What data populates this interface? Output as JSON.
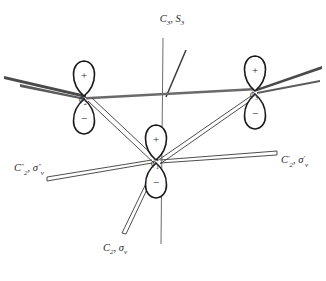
{
  "figure": {
    "title": "",
    "background_color": "#ffffff",
    "stroke_color": "#3a3a3a",
    "orbital_stroke_color": "#1a1a1a",
    "text_color": "#2b2b2b"
  },
  "orbitals": [
    {
      "id": "phi1",
      "label": "ϕ",
      "subscript": "1",
      "position": "center-bottom",
      "cx": 156,
      "cy": 160,
      "top_lobe_sign": "+",
      "bottom_lobe_sign": "−"
    },
    {
      "id": "phi2",
      "label": "ϕ",
      "subscript": "2",
      "position": "left",
      "cx": 84,
      "cy": 96,
      "top_lobe_sign": "+",
      "bottom_lobe_sign": "−"
    },
    {
      "id": "phi3",
      "label": "ϕ",
      "subscript": "3",
      "position": "right",
      "cx": 255,
      "cy": 91,
      "top_lobe_sign": "+",
      "bottom_lobe_sign": "−"
    }
  ],
  "symmetry_labels": {
    "principal_axis": {
      "text": "C₃, S₃",
      "main": "C",
      "main_sub": "3",
      "second": "S",
      "second_sub": "3",
      "x": 172,
      "y": 22
    },
    "c2_sigma_v": {
      "main": "C",
      "main_sub": "2",
      "main_prime": "",
      "second": "σ",
      "second_sub": "v",
      "second_prime": "",
      "text": "C₂, σᵥ",
      "x": 104,
      "y": 248
    },
    "c2_prime_sigma_v_prime": {
      "main": "C",
      "main_sub": "2",
      "main_prime": "′",
      "second": "σ",
      "second_sub": "v",
      "second_prime": "′",
      "text": "C₂′, σᵥ′",
      "x": 283,
      "y": 160
    },
    "c2_dprime_sigma_v_dprime": {
      "main": "C",
      "main_sub": "2",
      "main_prime": "″",
      "second": "σ",
      "second_sub": "v",
      "second_prime": "″",
      "text": "C₂″, σᵥ″",
      "x": 16,
      "y": 168
    }
  },
  "axes": {
    "vertical_axis_name": "c3-s3-principal-axis",
    "tilted_axis_name": "s3-improper-axis-indicator",
    "in_plane_left_name": "in-plane-axis-left",
    "in_plane_right_name": "in-plane-axis-right"
  },
  "bonds": [
    {
      "name": "bond-phi1-phi2"
    },
    {
      "name": "bond-phi1-phi3"
    },
    {
      "name": "c2-axis-lower"
    },
    {
      "name": "c2-prime-axis-upper-right"
    },
    {
      "name": "c2-dprime-axis-upper-left"
    }
  ]
}
